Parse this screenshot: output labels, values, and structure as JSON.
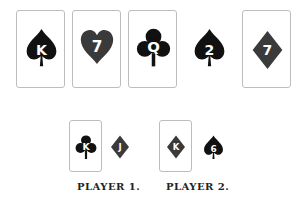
{
  "colors": {
    "black_suit": "#111111",
    "red_suit": "#3a3a3a",
    "card_border": "#bdbdbd",
    "rank_text": "#ffffff"
  },
  "table": {
    "cards": [
      {
        "rank": "K",
        "suit": "spade",
        "face_up_card": true
      },
      {
        "rank": "7",
        "suit": "heart",
        "face_up_card": true
      },
      {
        "rank": "Q",
        "suit": "club",
        "face_up_card": true
      },
      {
        "rank": "2",
        "suit": "spade",
        "face_up_card": false
      },
      {
        "rank": "7",
        "suit": "diamond",
        "face_up_card": true
      }
    ]
  },
  "players": [
    {
      "label": "PLAYER 1.",
      "cards": [
        {
          "rank": "K",
          "suit": "club",
          "framed": true
        },
        {
          "rank": "J",
          "suit": "diamond",
          "framed": false
        }
      ]
    },
    {
      "label": "PLAYER 2.",
      "cards": [
        {
          "rank": "K",
          "suit": "diamond",
          "framed": true
        },
        {
          "rank": "6",
          "suit": "spade",
          "framed": false
        }
      ]
    }
  ]
}
